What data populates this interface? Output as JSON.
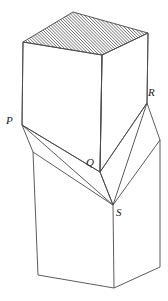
{
  "figure": {
    "background_color": "#ffffff",
    "stroke_color": "#4a4a4a",
    "hatch_color": "#3a3a3a",
    "label_color": "#1a1a1a",
    "stroke_width": 0.9,
    "labels": [
      {
        "id": "P",
        "text": "P",
        "x": 6,
        "y": 115
      },
      {
        "id": "Q",
        "text": "Q",
        "x": 86,
        "y": 157
      },
      {
        "id": "R",
        "text": "R",
        "x": 148,
        "y": 87
      },
      {
        "id": "S",
        "text": "S",
        "x": 116,
        "y": 207
      }
    ],
    "vertices": {
      "top_back": {
        "x": 73,
        "y": 12
      },
      "top_left": {
        "x": 23,
        "y": 42
      },
      "top_front": {
        "x": 102,
        "y": 55
      },
      "top_right": {
        "x": 148,
        "y": 33
      },
      "P": {
        "x": 22,
        "y": 125
      },
      "Q": {
        "x": 100,
        "y": 172
      },
      "R": {
        "x": 147,
        "y": 103
      },
      "S": {
        "x": 113,
        "y": 205
      },
      "lower_left_top": {
        "x": 33,
        "y": 152
      },
      "lower_right_top": {
        "x": 160,
        "y": 140
      },
      "bottom_left": {
        "x": 38,
        "y": 275
      },
      "bottom_front": {
        "x": 114,
        "y": 288
      },
      "bottom_right": {
        "x": 160,
        "y": 267
      }
    },
    "hatch": {
      "face": "top",
      "angle_degrees": 45,
      "spacing_px": 2.2,
      "direction": "lower-left to upper-right"
    }
  }
}
